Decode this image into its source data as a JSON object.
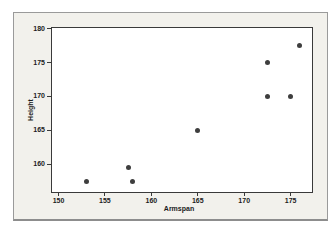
{
  "chart_data": {
    "type": "scatter",
    "title": "",
    "xlabel": "Armspan",
    "ylabel": "Height",
    "x_ticks": [
      150,
      155,
      160,
      165,
      170,
      175
    ],
    "y_ticks": [
      160,
      165,
      170,
      175,
      180
    ],
    "xlim": [
      149.3,
      177.3
    ],
    "ylim": [
      155.9,
      180.1
    ],
    "grid": false,
    "legend_position": "none",
    "marker": {
      "shape": "circle",
      "size_px": 5,
      "color": "#3e3e3e"
    },
    "points": [
      {
        "x": 153,
        "y": 157.5
      },
      {
        "x": 157.5,
        "y": 159.5
      },
      {
        "x": 158,
        "y": 157.5
      },
      {
        "x": 165,
        "y": 165
      },
      {
        "x": 172.5,
        "y": 175
      },
      {
        "x": 172.5,
        "y": 170
      },
      {
        "x": 175,
        "y": 170
      },
      {
        "x": 176,
        "y": 177.5
      }
    ]
  },
  "colors": {
    "page_background": "#ffffff",
    "panel_background": "#f2f1ec",
    "panel_border": "#9a9a9a",
    "plot_background": "#ffffff",
    "frame": "#3a3a3a",
    "text": "#1c1c1c"
  }
}
